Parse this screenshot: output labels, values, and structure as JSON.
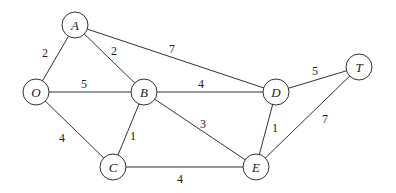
{
  "graph": {
    "nodes": [
      {
        "id": "A",
        "label": "A",
        "x": 75,
        "y": 25
      },
      {
        "id": "O",
        "label": "O",
        "x": 36,
        "y": 92
      },
      {
        "id": "B",
        "label": "B",
        "x": 144,
        "y": 92
      },
      {
        "id": "C",
        "label": "C",
        "x": 113,
        "y": 167
      },
      {
        "id": "D",
        "label": "D",
        "x": 276,
        "y": 92
      },
      {
        "id": "T",
        "label": "T",
        "x": 359,
        "y": 67
      },
      {
        "id": "E",
        "label": "E",
        "x": 256,
        "y": 167
      }
    ],
    "edges": [
      {
        "from": "O",
        "to": "A",
        "weight": "2",
        "lx": 45,
        "ly": 57
      },
      {
        "from": "A",
        "to": "B",
        "weight": "2",
        "lx": 114,
        "ly": 55
      },
      {
        "from": "A",
        "to": "D",
        "weight": "7",
        "lx": 172,
        "ly": 53
      },
      {
        "from": "O",
        "to": "B",
        "weight": "5",
        "lx": 84,
        "ly": 88
      },
      {
        "from": "B",
        "to": "D",
        "weight": "4",
        "lx": 201,
        "ly": 88
      },
      {
        "from": "O",
        "to": "C",
        "weight": "4",
        "lx": 62,
        "ly": 142
      },
      {
        "from": "B",
        "to": "C",
        "weight": "1",
        "lx": 133,
        "ly": 140
      },
      {
        "from": "B",
        "to": "E",
        "weight": "3",
        "lx": 203,
        "ly": 128
      },
      {
        "from": "C",
        "to": "E",
        "weight": "4",
        "lx": 180,
        "ly": 183
      },
      {
        "from": "D",
        "to": "E",
        "weight": "1",
        "lx": 275,
        "ly": 132
      },
      {
        "from": "D",
        "to": "T",
        "weight": "5",
        "lx": 315,
        "ly": 75
      },
      {
        "from": "E",
        "to": "T",
        "weight": "7",
        "lx": 325,
        "ly": 123
      }
    ]
  }
}
